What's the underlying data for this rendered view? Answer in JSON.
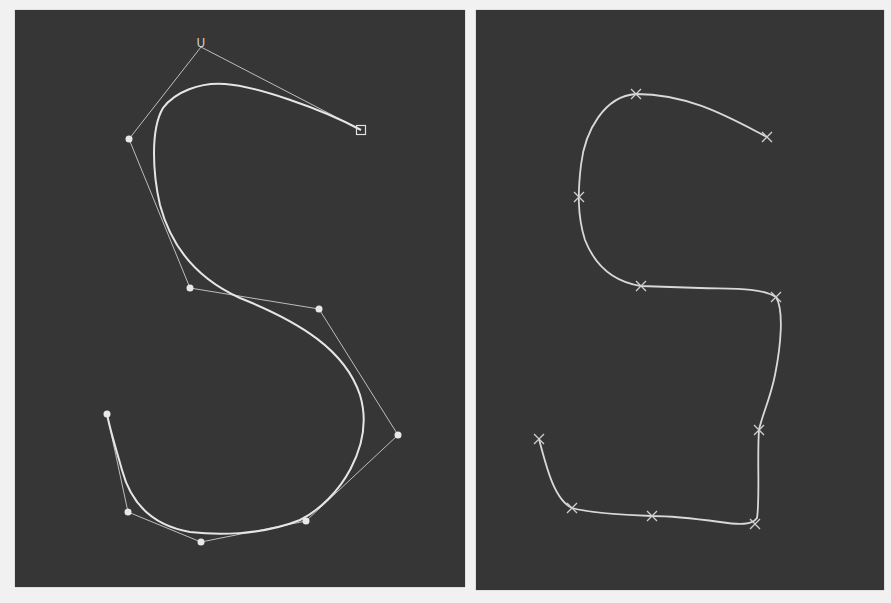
{
  "colors": {
    "background": "#f1f1f1",
    "panel": "#363636",
    "curve": "#e6e6e6",
    "control_polygon": "#bdbdbd",
    "points": "#e8e8e8"
  },
  "panels": [
    {
      "name": "bezier-spline-with-control-points",
      "start_label": "U",
      "control_points": [
        [
          201,
          47
        ],
        [
          129,
          139
        ],
        [
          190,
          288
        ],
        [
          319,
          309
        ],
        [
          398,
          435
        ],
        [
          306,
          521
        ],
        [
          201,
          542
        ],
        [
          128,
          512
        ],
        [
          107,
          414
        ]
      ],
      "end_handle": [
        361,
        130
      ],
      "curve_path": "M361,130 C320,108 255,86 225,84 C200,82 175,92 163,108 C150,130 153,175 160,205 C172,250 200,280 240,298 C300,322 345,350 360,395 C375,445 340,500 300,520 C260,536 215,535 190,532 C150,525 130,500 122,470 C115,445 110,430 107,414"
    },
    {
      "name": "interpolating-spline-through-points",
      "points": [
        [
          767,
          137
        ],
        [
          636,
          94
        ],
        [
          579,
          197
        ],
        [
          641,
          286
        ],
        [
          776,
          297
        ],
        [
          759,
          430
        ],
        [
          755,
          524
        ],
        [
          652,
          516
        ],
        [
          572,
          508
        ],
        [
          539,
          439
        ]
      ],
      "curve_path": "M767,137 C730,118 690,94 636,94 C605,96 585,130 581,165 C578,190 577,215 585,240 C596,268 615,282 641,286 L700,288 C730,289 760,287 776,297 C784,310 781,345 775,375 C770,400 762,415 759,430 C757,455 760,500 757,518 C752,525 740,525 720,522 C690,518 670,516 652,516 C620,515 590,513 572,508 C555,500 547,470 539,439"
    }
  ]
}
